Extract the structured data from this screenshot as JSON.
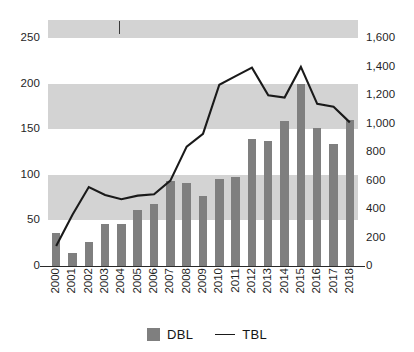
{
  "chart_data": {
    "type": "bar",
    "title": "",
    "subtitle": "",
    "xlabel": "",
    "ylabel": "",
    "y2label": "",
    "grid": "horizontal-banded",
    "legend_position": "bottom",
    "categories": [
      "2000",
      "2001",
      "2002",
      "2003",
      "2004",
      "2005",
      "2006",
      "2007",
      "2008",
      "2009",
      "2010",
      "2011",
      "2012",
      "2013",
      "2014",
      "2015",
      "2016",
      "2017",
      "2018"
    ],
    "ylim": [
      0,
      270
    ],
    "y2lim": [
      0,
      1730
    ],
    "yticks": [
      "0",
      "50",
      "100",
      "150",
      "200",
      "250"
    ],
    "ytick_values": [
      0,
      50,
      100,
      150,
      200,
      250
    ],
    "y2ticks": [
      "0",
      "200",
      "400",
      "600",
      "800",
      "1,000",
      "1,200",
      "1,400",
      "1,600"
    ],
    "y2tick_values": [
      0,
      200,
      400,
      600,
      800,
      1000,
      1200,
      1400,
      1600
    ],
    "series": [
      {
        "name": "DBL",
        "type": "bar",
        "axis": "left",
        "color": "#7f7f7f",
        "values": [
          36,
          14,
          26,
          46,
          46,
          61,
          68,
          93,
          91,
          77,
          96,
          98,
          139,
          137,
          159,
          200,
          151,
          134,
          160
        ]
      },
      {
        "name": "TBL",
        "type": "line",
        "axis": "right",
        "color": "#1a1a1a",
        "values": [
          140,
          360,
          555,
          500,
          470,
          495,
          505,
          600,
          840,
          930,
          1275,
          1335,
          1395,
          1200,
          1185,
          1400,
          1140,
          1120,
          1010
        ]
      }
    ]
  },
  "legend": {
    "items": [
      {
        "label": "DBL",
        "marker": "square-swatch"
      },
      {
        "label": "TBL",
        "marker": "line-swatch"
      }
    ]
  }
}
